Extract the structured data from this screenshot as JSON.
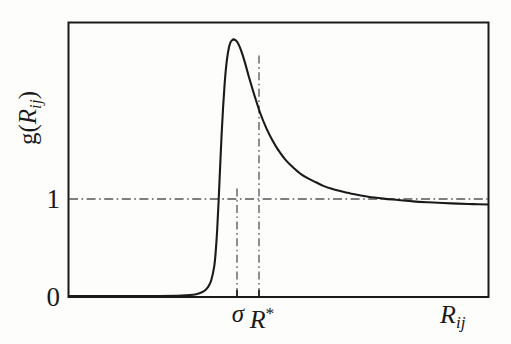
{
  "figure": {
    "kind": "line-plot",
    "background_color": "#fdfdfb",
    "frame_color": "#1a1a1a",
    "curve_color": "#1a1a1a",
    "guide_color": "#55555a"
  },
  "axes": {
    "y_label_main": "g",
    "y_label_open_paren": "(",
    "y_label_var": "R",
    "y_label_sub": "ij",
    "y_label_close_paren": ")",
    "y_ticks": [
      {
        "label": "1",
        "value": 1
      },
      {
        "label": "0",
        "value": 0
      }
    ],
    "x_ticks": [
      {
        "label": "σ",
        "value": 1.0
      },
      {
        "label_var": "R",
        "label_sup": "*",
        "value": 1.12
      }
    ],
    "x_label_var": "R",
    "x_label_sub": "ij"
  },
  "chart_data": {
    "type": "line",
    "title": "",
    "xlabel": "R_ij",
    "ylabel": "g(R_ij)",
    "xlim": [
      0,
      2.8
    ],
    "ylim": [
      0,
      3.0
    ],
    "grid": false,
    "legend": null,
    "annotations": [
      {
        "name": "sigma-vline",
        "style": "dash-dot",
        "orientation": "vertical",
        "x": 1.0,
        "label": "σ"
      },
      {
        "name": "rstar-vline",
        "style": "dash-dot",
        "orientation": "vertical",
        "x": 1.12,
        "label": "R*"
      },
      {
        "name": "unity-hline",
        "style": "dash-dot",
        "orientation": "horizontal",
        "y": 1.0,
        "label": "1"
      }
    ],
    "series": [
      {
        "name": "radial distribution function",
        "x": [
          0.0,
          0.2,
          0.4,
          0.6,
          0.75,
          0.85,
          0.9,
          0.93,
          0.95,
          0.97,
          0.98,
          0.99,
          1.0,
          1.01,
          1.02,
          1.03,
          1.04,
          1.05,
          1.06,
          1.07,
          1.08,
          1.09,
          1.1,
          1.12,
          1.14,
          1.16,
          1.18,
          1.2,
          1.24,
          1.28,
          1.32,
          1.36,
          1.4,
          1.45,
          1.5,
          1.55,
          1.6,
          1.65,
          1.7,
          1.75,
          1.8,
          1.9,
          2.0,
          2.1,
          2.2,
          2.3,
          2.4,
          2.5,
          2.6,
          2.7,
          2.8
        ],
        "y": [
          0.0,
          0.0,
          0.0,
          0.0,
          0.005,
          0.02,
          0.05,
          0.1,
          0.17,
          0.32,
          0.48,
          0.72,
          1.05,
          1.42,
          1.78,
          2.08,
          2.33,
          2.52,
          2.65,
          2.74,
          2.79,
          2.81,
          2.82,
          2.8,
          2.74,
          2.65,
          2.54,
          2.42,
          2.2,
          2.0,
          1.84,
          1.71,
          1.6,
          1.49,
          1.41,
          1.34,
          1.29,
          1.25,
          1.21,
          1.18,
          1.16,
          1.12,
          1.09,
          1.07,
          1.055,
          1.04,
          1.03,
          1.022,
          1.015,
          1.01,
          1.005
        ]
      }
    ]
  }
}
